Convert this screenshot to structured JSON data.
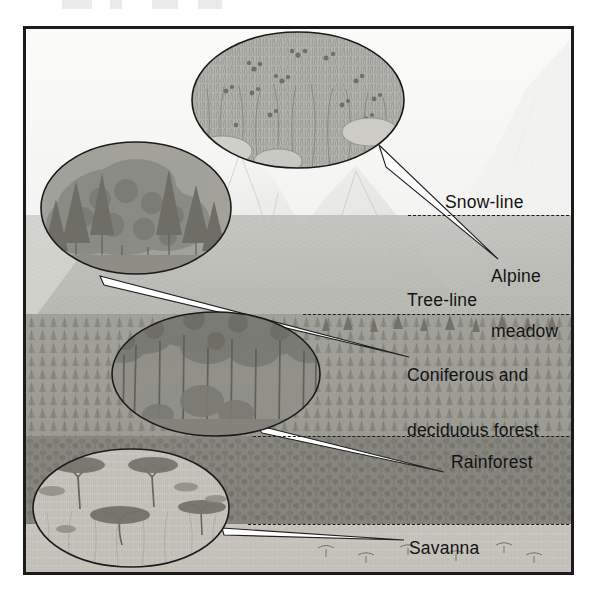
{
  "figure": {
    "kind": "altitudinal-vegetation-zones-diagram",
    "medium": "grayscale pencil illustration",
    "frame_color": "#1b1b1b",
    "background_color": "#f2f2f0"
  },
  "scan_artifacts": {
    "present": true,
    "description": "faint clipped text remnants along top edge"
  },
  "zones": [
    {
      "id": "snow-line",
      "label": "Snow-line",
      "label_x": 442,
      "label_y": 190,
      "boundary_y": 212,
      "boundary_x1": 405,
      "boundary_x2": 572,
      "lines": 1
    },
    {
      "id": "alpine-meadow",
      "label_line1": "Alpine",
      "label_line2": "meadow",
      "label_x": 488,
      "label_y": 228,
      "lines": 2
    },
    {
      "id": "tree-line",
      "label": "Tree-line",
      "label_x": 404,
      "label_y": 288,
      "boundary_y": 311,
      "boundary_x1": 300,
      "boundary_x2": 572,
      "lines": 1
    },
    {
      "id": "coniferous-deciduous-forest",
      "label_line1": "Coniferous and",
      "label_line2": "deciduous forest",
      "label_x": 404,
      "label_y": 327,
      "lines": 2
    },
    {
      "id": "rainforest",
      "label": "Rainforest",
      "label_x": 448,
      "label_y": 450,
      "boundary_y": 433,
      "boundary_x1": 250,
      "boundary_x2": 572,
      "lines": 1
    },
    {
      "id": "savanna",
      "label": "Savanna",
      "label_x": 406,
      "label_y": 536,
      "boundary_y": 521,
      "boundary_x1": 245,
      "boundary_x2": 572,
      "lines": 1
    }
  ],
  "callouts": [
    {
      "id": "alpine-meadow-callout",
      "subject": "Alpine meadow",
      "content": "tufted grasses with small wildflowers and scattered boulders",
      "cx": 295,
      "cy": 97,
      "rx": 106,
      "ry": 68,
      "points_to": "alpine-meadow"
    },
    {
      "id": "coniferous-deciduous-callout",
      "subject": "Coniferous and deciduous forest",
      "content": "spruce and fir conifers mixed with broadleaf deciduous trees",
      "cx": 133,
      "cy": 205,
      "rx": 95,
      "ry": 66,
      "points_to": "coniferous-deciduous-forest"
    },
    {
      "id": "rainforest-callout",
      "subject": "Rainforest",
      "content": "tall straight-trunked trees forming a dense closed canopy",
      "cx": 213,
      "cy": 371,
      "rx": 104,
      "ry": 62,
      "points_to": "rainforest"
    },
    {
      "id": "savanna-callout",
      "subject": "Savanna",
      "content": "open grassland dotted with flat-topped acacia trees",
      "cx": 128,
      "cy": 505,
      "rx": 98,
      "ry": 59,
      "points_to": "savanna"
    }
  ],
  "scene": {
    "main_peak": "large snow-capped mountain at right",
    "secondary_peaks": "lower snow-dusted ridge at centre-left",
    "haze": "pale sky gradient behind the peaks"
  }
}
